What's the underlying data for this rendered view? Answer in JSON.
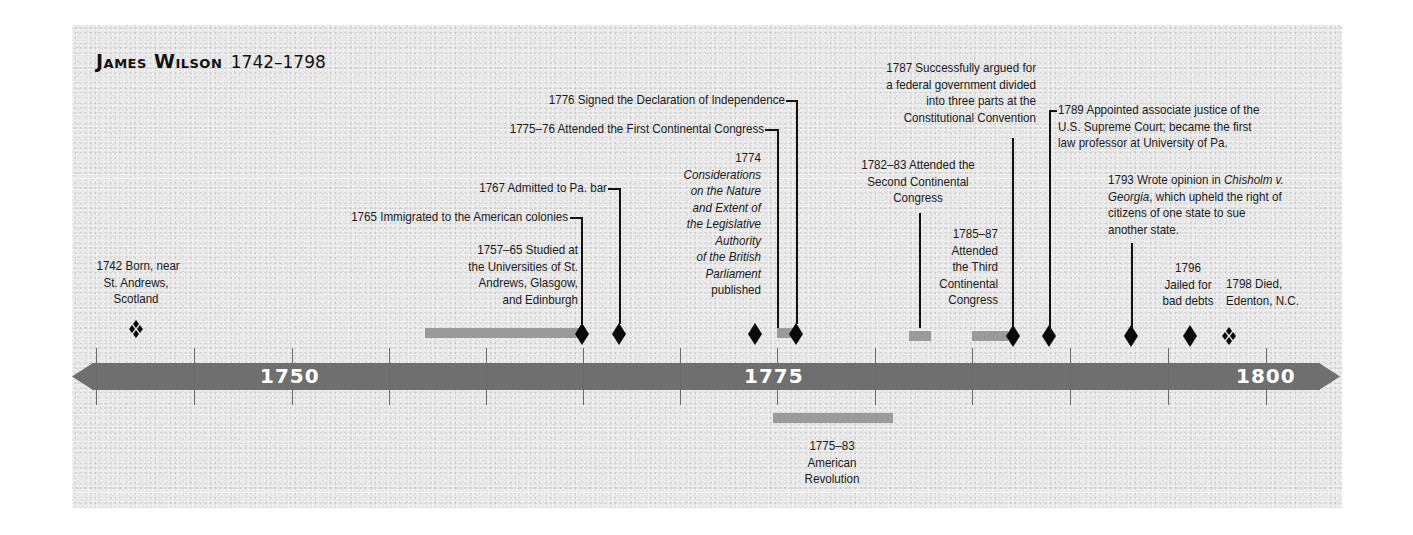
{
  "title": {
    "name": "James Wilson",
    "years": "1742–1798"
  },
  "axis": {
    "start_year": 1740,
    "end_year": 1800,
    "tick_interval": 5,
    "labels": [
      {
        "year": 1750,
        "text": "1750"
      },
      {
        "year": 1775,
        "text": "1775"
      },
      {
        "year": 1800,
        "text": "1800"
      }
    ],
    "color": "#6f6f6f"
  },
  "colors": {
    "background": "#e6e6e6",
    "axis": "#6f6f6f",
    "span_bar": "#9a9a9a",
    "marker": "#0a0a0a",
    "text": "#1a1a1a"
  },
  "events": [
    {
      "id": "born",
      "year": "1742",
      "marker": "quad-diamond",
      "text": "1742 Born, near St. Andrews, Scotland",
      "lines": [
        "1742 Born, near",
        "St. Andrews,",
        "Scotland"
      ]
    },
    {
      "id": "studied",
      "year": "1757–65",
      "marker": "span-with-diamond",
      "lines": [
        "1757–65 Studied at",
        "the Universities of St.",
        "Andrews, Glasgow,",
        "and Edinburgh"
      ]
    },
    {
      "id": "immigrated",
      "year": "1765",
      "marker": "diamond",
      "lines": [
        "1765 Immigrated to the American colonies"
      ]
    },
    {
      "id": "pa-bar",
      "year": "1767",
      "marker": "diamond",
      "lines": [
        "1767 Admitted to Pa. bar"
      ]
    },
    {
      "id": "considerations",
      "year": "1774",
      "marker": "diamond",
      "lines_year": "1774",
      "lines_italic": [
        "Considerations",
        "on the Nature",
        "and Extent of",
        "the Legislative",
        "Authority",
        "of the British",
        "Parliament"
      ],
      "lines_tail": "published"
    },
    {
      "id": "first-congress",
      "year": "1775–76",
      "marker": "span",
      "lines": [
        "1775–76 Attended the First Continental Congress"
      ]
    },
    {
      "id": "declaration",
      "year": "1776",
      "marker": "diamond",
      "lines": [
        "1776 Signed the Declaration of Independence"
      ]
    },
    {
      "id": "revolution",
      "year": "1775–83",
      "marker": "span-below",
      "lines": [
        "1775–83",
        "American",
        "Revolution"
      ]
    },
    {
      "id": "second-congress",
      "year": "1782–83",
      "marker": "span",
      "lines": [
        "1782–83 Attended the",
        "Second Continental",
        "Congress"
      ]
    },
    {
      "id": "third-congress",
      "year": "1785–87",
      "marker": "span",
      "lines": [
        "1785–87",
        "Attended",
        "the Third",
        "Continental",
        "Congress"
      ]
    },
    {
      "id": "convention",
      "year": "1787",
      "marker": "diamond",
      "lines": [
        "1787 Successfully argued for",
        "a federal government divided",
        "into three parts at the",
        "Constitutional Convention"
      ]
    },
    {
      "id": "supreme-court",
      "year": "1789",
      "marker": "diamond",
      "lines": [
        "1789 Appointed associate justice of the",
        "U.S. Supreme Court; became the first",
        "law professor at University of Pa."
      ]
    },
    {
      "id": "chisholm",
      "year": "1793",
      "marker": "diamond",
      "line1_pre": "1793 Wrote opinion in ",
      "line1_italic": "Chisholm v.",
      "line2_italic": "Georgia",
      "line2_post": ", which upheld the right of",
      "lines_rest": [
        "citizens of one state to sue",
        "another state."
      ]
    },
    {
      "id": "jailed",
      "year": "1796",
      "marker": "diamond",
      "lines": [
        "1796",
        "Jailed for",
        "bad debts"
      ]
    },
    {
      "id": "died",
      "year": "1798",
      "marker": "quad-diamond",
      "lines": [
        "1798 Died,",
        "Edenton, N.C."
      ]
    }
  ]
}
